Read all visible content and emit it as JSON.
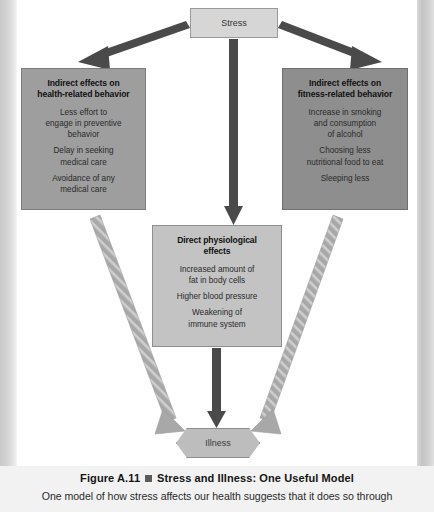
{
  "figure": {
    "nodes": {
      "stress": {
        "label": "Stress"
      },
      "indirect_health": {
        "title_line1": "Indirect effects on",
        "title_line2": "health-related behavior",
        "items": [
          "Less effort to\nengage in preventive\nbehavior",
          "Delay in seeking\nmedical care",
          "Avoidance of any\nmedical care"
        ]
      },
      "indirect_fitness": {
        "title_line1": "Indirect effects on",
        "title_line2": "fitness-related behavior",
        "items": [
          "Increase in smoking\nand consumption\nof alcohol",
          "Choosing less\nnutritional food to eat",
          "Sleeping less"
        ]
      },
      "direct_physiological": {
        "title_line1": "Direct physiological",
        "title_line2": "effects",
        "items": [
          "Increased amount of\nfat in body cells",
          "Higher blood pressure",
          "Weakening of\nimmune system"
        ]
      },
      "illness": {
        "label": "Illness"
      }
    },
    "arrows": [
      {
        "name": "stress-to-indirect-health",
        "style": "solid-dark"
      },
      {
        "name": "stress-to-indirect-fitness",
        "style": "solid-dark"
      },
      {
        "name": "stress-to-direct-physiological",
        "style": "solid-dark"
      },
      {
        "name": "indirect-health-to-illness",
        "style": "dashed-light"
      },
      {
        "name": "indirect-fitness-to-illness",
        "style": "dashed-light"
      },
      {
        "name": "direct-physiological-to-illness",
        "style": "solid-dark"
      }
    ],
    "colors": {
      "arrow_dark": "#4a4a4a",
      "arrow_light": "#a8a8a8",
      "box_stress": "#d6d6d6",
      "box_left": "#9e9e9e",
      "box_right": "#8e8e8e",
      "box_center": "#c3c3c3",
      "box_illness": "#bdbdbd",
      "caption_bullet": "#5c5c5c"
    }
  },
  "caption": {
    "figure_number": "Figure A.11",
    "title": "Stress and Illness: One Useful Model",
    "body": "One model of how stress affects our health suggests that it does so through"
  }
}
